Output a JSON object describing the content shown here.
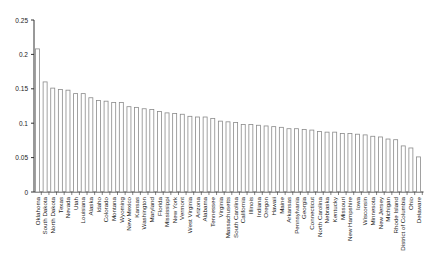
{
  "chart_data": {
    "type": "bar",
    "title": "",
    "xlabel": "",
    "ylabel": "",
    "ylim": [
      0,
      0.25
    ],
    "yticks": [
      "0",
      "0.05",
      "0.1",
      "0.15",
      "0.2",
      "0.25"
    ],
    "grid": false,
    "legend": null,
    "bar_fill": "#ffffff",
    "bar_stroke": "#8a8a8a",
    "categories": [
      "Oklahoma",
      "South Dakota",
      "North Dakota",
      "Texas",
      "Nevada",
      "Utah",
      "Louisiana",
      "Alaska",
      "Idaho",
      "Colorado",
      "Montana",
      "Wyoming",
      "New Mexico",
      "Kansas",
      "Washington",
      "Maryland",
      "Florida",
      "Mississippi",
      "New York",
      "Vermont",
      "West Virginia",
      "Arizona",
      "Alabama",
      "Tennessee",
      "Virginia",
      "Massachusetts",
      "South Carolina",
      "California",
      "Illinois",
      "Indiana",
      "Oregon",
      "Hawaii",
      "Maine",
      "Arkansas",
      "Pennsylvania",
      "Georgia",
      "Connecticut",
      "North Carolina",
      "Nebraska",
      "Kentucky",
      "Missouri",
      "New Hampshire",
      "Iowa",
      "Wisconsin",
      "Minnesota",
      "New Jersey",
      "Michigan",
      "Rhode Island",
      "District of Columbia",
      "Ohio",
      "Delaware"
    ],
    "values": [
      0.208,
      0.16,
      0.151,
      0.149,
      0.148,
      0.143,
      0.143,
      0.137,
      0.133,
      0.132,
      0.13,
      0.13,
      0.124,
      0.123,
      0.121,
      0.12,
      0.117,
      0.115,
      0.114,
      0.113,
      0.11,
      0.109,
      0.109,
      0.107,
      0.103,
      0.102,
      0.101,
      0.098,
      0.098,
      0.097,
      0.096,
      0.095,
      0.094,
      0.092,
      0.092,
      0.091,
      0.09,
      0.088,
      0.087,
      0.087,
      0.085,
      0.085,
      0.084,
      0.083,
      0.081,
      0.08,
      0.077,
      0.076,
      0.067,
      0.064,
      0.051
    ]
  }
}
